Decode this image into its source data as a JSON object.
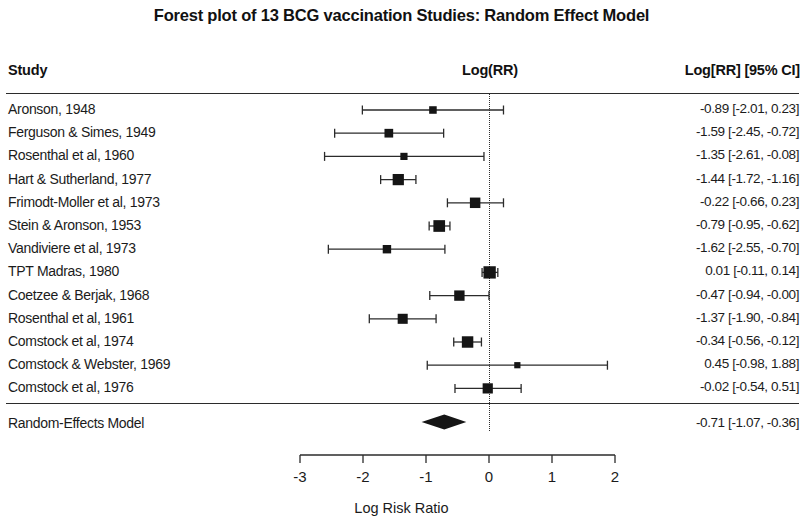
{
  "title": "Forest plot of 13 BCG vaccination Studies: Random Effect Model",
  "headers": {
    "study": "Study",
    "forest": "Log(RR)",
    "estimate": "Log[RR] [95% CI]"
  },
  "axis": {
    "label": "Log Risk Ratio",
    "ticks": [
      -3,
      -2,
      -1,
      0,
      1,
      2
    ],
    "tick_labels": [
      "-3",
      "-2",
      "-1",
      "0",
      "1",
      "2"
    ],
    "min": -3,
    "max": 2,
    "reference_line": 0
  },
  "summary": {
    "label": "Random-Effects Model",
    "estimate_text": "-0.71 [-1.07, -0.36]",
    "estimate": -0.71,
    "ci_low": -1.07,
    "ci_high": -0.36
  },
  "colors": {
    "marker": "#151515",
    "line": "#2b2b2b",
    "text": "#1b1b1b",
    "background": "#ffffff"
  },
  "chart_data": {
    "type": "forest",
    "title": "Forest plot of 13 BCG vaccination Studies: Random Effect Model",
    "xlabel": "Log Risk Ratio",
    "ylabel": "",
    "xlim": [
      -3,
      2
    ],
    "grid": false,
    "reference_line": 0,
    "effect_measure": "Log Risk Ratio",
    "model": "Random-Effects Model",
    "columns": [
      "Study",
      "Log(RR)",
      "Log[RR] [95% CI]"
    ],
    "studies": [
      {
        "label": "Aronson, 1948",
        "estimate": -0.89,
        "ci_low": -2.01,
        "ci_high": 0.23,
        "estimate_text": "-0.89 [-2.01,  0.23]",
        "weight": 2.5
      },
      {
        "label": "Ferguson & Simes, 1949",
        "estimate": -1.59,
        "ci_low": -2.45,
        "ci_high": -0.72,
        "estimate_text": "-1.59 [-2.45, -0.72]",
        "weight": 4.0
      },
      {
        "label": "Rosenthal et al, 1960",
        "estimate": -1.35,
        "ci_low": -2.61,
        "ci_high": -0.08,
        "estimate_text": "-1.35 [-2.61, -0.08]",
        "weight": 2.1
      },
      {
        "label": "Hart & Sutherland, 1977",
        "estimate": -1.44,
        "ci_low": -1.72,
        "ci_high": -1.16,
        "estimate_text": "-1.44 [-1.72, -1.16]",
        "weight": 8.5
      },
      {
        "label": "Frimodt-Moller et al, 1973",
        "estimate": -0.22,
        "ci_low": -0.66,
        "ci_high": 0.23,
        "estimate_text": "-0.22 [-0.66,  0.23]",
        "weight": 7.0
      },
      {
        "label": "Stein & Aronson, 1953",
        "estimate": -0.79,
        "ci_low": -0.95,
        "ci_high": -0.62,
        "estimate_text": "-0.79 [-0.95, -0.62]",
        "weight": 9.5
      },
      {
        "label": "Vandiviere et al, 1973",
        "estimate": -1.62,
        "ci_low": -2.55,
        "ci_high": -0.7,
        "estimate_text": "-1.62 [-2.55, -0.70]",
        "weight": 3.6
      },
      {
        "label": "TPT Madras, 1980",
        "estimate": 0.01,
        "ci_low": -0.11,
        "ci_high": 0.14,
        "estimate_text": " 0.01 [-0.11,  0.14]",
        "weight": 11.0
      },
      {
        "label": "Coetzee & Berjak, 1968",
        "estimate": -0.47,
        "ci_low": -0.94,
        "ci_high": -0.0,
        "estimate_text": "-0.47 [-0.94, -0.00]",
        "weight": 6.8
      },
      {
        "label": "Rosenthal et al, 1961",
        "estimate": -1.37,
        "ci_low": -1.9,
        "ci_high": -0.84,
        "estimate_text": "-1.37 [-1.90, -0.84]",
        "weight": 6.2
      },
      {
        "label": "Comstock et al, 1974",
        "estimate": -0.34,
        "ci_low": -0.56,
        "ci_high": -0.12,
        "estimate_text": "-0.34 [-0.56, -0.12]",
        "weight": 9.0
      },
      {
        "label": "Comstock & Webster, 1969",
        "estimate": 0.45,
        "ci_low": -0.98,
        "ci_high": 1.88,
        "estimate_text": " 0.45 [-0.98,  1.88]",
        "weight": 1.2
      },
      {
        "label": "Comstock et al, 1976",
        "estimate": -0.02,
        "ci_low": -0.54,
        "ci_high": 0.51,
        "estimate_text": "-0.02 [-0.54,  0.51]",
        "weight": 6.5
      }
    ],
    "summary": {
      "label": "Random-Effects Model",
      "estimate": -0.71,
      "ci_low": -1.07,
      "ci_high": -0.36,
      "estimate_text": "-0.71 [-1.07, -0.36]"
    }
  }
}
